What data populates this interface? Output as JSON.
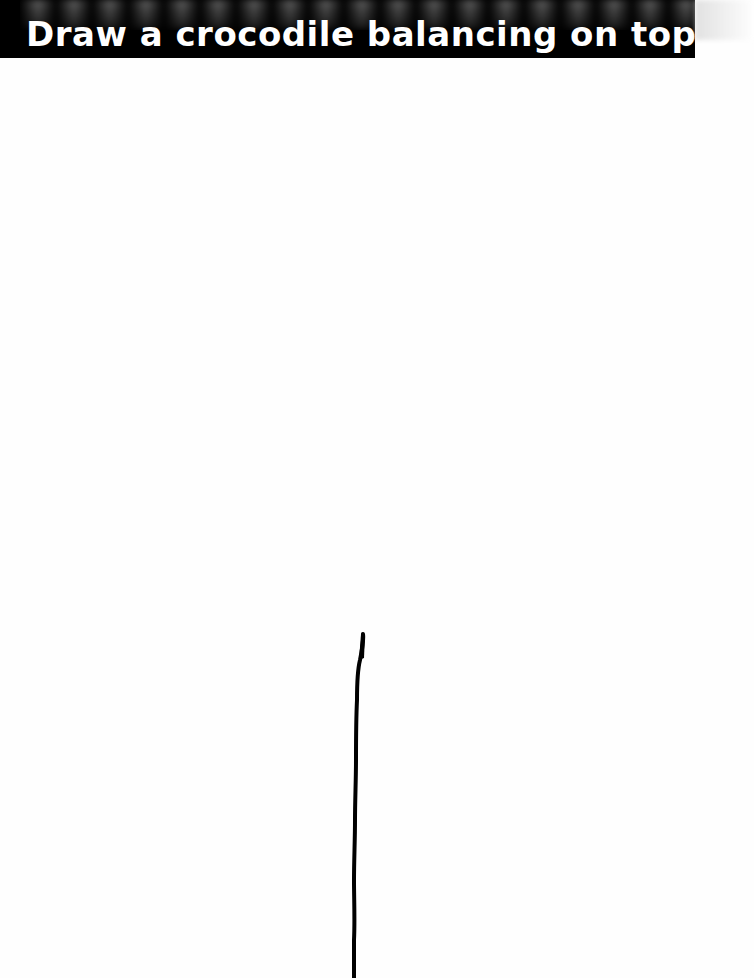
{
  "prompt": {
    "text": "Draw a crocodile balancing on top of this pole"
  },
  "colors": {
    "banner_bg": "#000000",
    "banner_text": "#ffffff",
    "canvas_bg": "#fefefe",
    "pole_stroke": "#000000"
  },
  "canvas": {
    "pole": {
      "top": [
        362,
        634
      ],
      "bottom": [
        353,
        978
      ]
    }
  }
}
